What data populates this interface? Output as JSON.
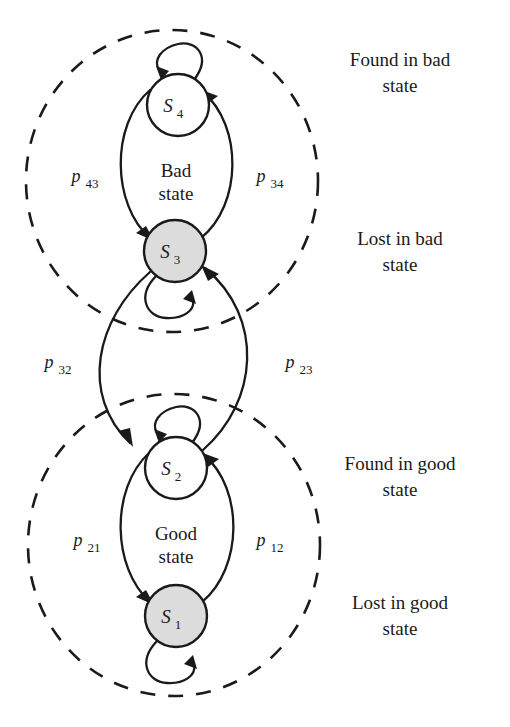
{
  "diagram": {
    "type": "markov-state-transition",
    "background_color": "#ffffff",
    "stroke_color": "#1a1a1a",
    "node_fill_active": "#dcdcdc",
    "node_fill_inactive": "#ffffff"
  },
  "states": [
    {
      "id": "S4",
      "base": "S",
      "index": "4",
      "fill": "white",
      "cx": 178,
      "cy": 105,
      "r": 31,
      "group": "bad",
      "annotation": "Found in bad state"
    },
    {
      "id": "S3",
      "base": "S",
      "index": "3",
      "fill": "gray",
      "cx": 175,
      "cy": 251,
      "r": 31,
      "group": "bad",
      "annotation": "Lost in bad state"
    },
    {
      "id": "S2",
      "base": "S",
      "index": "2",
      "fill": "white",
      "cx": 176,
      "cy": 468,
      "r": 31,
      "group": "good",
      "annotation": "Found in good state"
    },
    {
      "id": "S1",
      "base": "S",
      "index": "1",
      "fill": "gray",
      "cx": 176,
      "cy": 616,
      "r": 31,
      "group": "good",
      "annotation": "Lost in good state"
    }
  ],
  "groups": [
    {
      "id": "bad",
      "label_line1": "Bad",
      "label_line2": "state",
      "label_x": 176,
      "label_y1": 177,
      "label_y2": 200,
      "ellipse_cx": 172,
      "ellipse_cy": 181,
      "ellipse_rx": 146,
      "ellipse_ry": 151
    },
    {
      "id": "good",
      "label_line1": "Good",
      "label_line2": "state",
      "label_x": 176,
      "label_y1": 540,
      "label_y2": 563,
      "ellipse_cx": 174,
      "ellipse_cy": 545,
      "ellipse_rx": 146,
      "ellipse_ry": 151
    }
  ],
  "transitions": [
    {
      "id": "p43",
      "base": "p",
      "index": "43",
      "from": "S4",
      "to": "S3",
      "label_x": 82,
      "label_y": 182,
      "side": "left"
    },
    {
      "id": "p34",
      "base": "p",
      "index": "34",
      "from": "S3",
      "to": "S4",
      "label_x": 267,
      "label_y": 182,
      "side": "right"
    },
    {
      "id": "p32",
      "base": "p",
      "index": "32",
      "from": "S3",
      "to": "S2",
      "label_x": 55,
      "label_y": 368,
      "side": "left"
    },
    {
      "id": "p23",
      "base": "p",
      "index": "23",
      "from": "S2",
      "to": "S3",
      "label_x": 296,
      "label_y": 368,
      "side": "right"
    },
    {
      "id": "p21",
      "base": "p",
      "index": "21",
      "from": "S2",
      "to": "S1",
      "label_x": 84,
      "label_y": 546,
      "side": "left"
    },
    {
      "id": "p12",
      "base": "p",
      "index": "12",
      "from": "S1",
      "to": "S2",
      "label_x": 267,
      "label_y": 546,
      "side": "right"
    }
  ],
  "self_loops": [
    {
      "id": "loop-S4",
      "state": "S4",
      "position": "top"
    },
    {
      "id": "loop-S3",
      "state": "S3",
      "position": "bottom"
    },
    {
      "id": "loop-S2",
      "state": "S2",
      "position": "top"
    },
    {
      "id": "loop-S1",
      "state": "S1",
      "position": "bottom"
    }
  ],
  "annotations": [
    {
      "id": "found-in-bad",
      "line1": "Found in bad",
      "line2": "state",
      "x": 400,
      "y1": 66,
      "y2": 92
    },
    {
      "id": "lost-in-bad",
      "line1": "Lost in bad",
      "line2": "state",
      "x": 400,
      "y1": 245,
      "y2": 271
    },
    {
      "id": "found-in-good",
      "line1": "Found in good",
      "line2": "state",
      "x": 400,
      "y1": 470,
      "y2": 496
    },
    {
      "id": "lost-in-good",
      "line1": "Lost in good",
      "line2": "state",
      "x": 400,
      "y1": 609,
      "y2": 635
    }
  ]
}
